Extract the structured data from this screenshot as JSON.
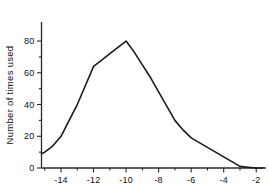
{
  "chart_data": {
    "type": "line",
    "title": "",
    "xlabel": "",
    "ylabel": "Number of times used",
    "xlim": [
      -15.2,
      -1.4
    ],
    "ylim": [
      0,
      92
    ],
    "grid": false,
    "legend": null,
    "axis_style": "left-and-bottom-spines-with-outward-ticks",
    "x_ticks_major": [
      -14,
      -12,
      -10,
      -8,
      -6,
      -4,
      -2
    ],
    "x_tick_labels": [
      "-14",
      "-12",
      "-10",
      "-8",
      "-6",
      "-4",
      "-2"
    ],
    "x_ticks_minor": [
      -15,
      -13,
      -11,
      -9,
      -7,
      -5,
      -3
    ],
    "y_ticks_major": [
      0,
      20,
      40,
      60,
      80
    ],
    "y_tick_labels": [
      "0",
      "20",
      "40",
      "60",
      "80"
    ],
    "y_ticks_minor": [
      10,
      30,
      50,
      70
    ],
    "x": [
      -15.2,
      -15,
      -14.5,
      -14,
      -13.5,
      -13,
      -12.5,
      -12,
      -11.5,
      -11,
      -10.5,
      -10,
      -9.5,
      -9,
      -8.5,
      -8,
      -7.5,
      -7,
      -6.5,
      -6,
      -5.5,
      -5,
      -4.5,
      -4,
      -3.5,
      -3,
      -2.5,
      -2,
      -1.6
    ],
    "values": [
      9,
      10,
      14,
      20,
      30,
      40,
      52,
      64,
      68,
      72,
      76,
      80,
      73,
      65,
      57,
      48,
      39,
      30,
      24,
      19,
      16,
      13,
      10,
      7,
      4,
      1,
      0.5,
      0,
      0
    ],
    "series": [
      {
        "name": "Number of times used",
        "color": "#1a1a1a",
        "line_width": 1.6,
        "marker": "none",
        "values": [
          9,
          10,
          14,
          20,
          30,
          40,
          52,
          64,
          68,
          72,
          76,
          80,
          73,
          65,
          57,
          48,
          39,
          30,
          24,
          19,
          16,
          13,
          10,
          7,
          4,
          1,
          0.5,
          0,
          0
        ]
      }
    ],
    "annotations": [
      {
        "label": "peak",
        "x": -10,
        "y": 80
      },
      {
        "label": "shoulder",
        "x": -12,
        "y": 64
      },
      {
        "label": "knee",
        "x": -7,
        "y": 30
      },
      {
        "label": "tail-zero",
        "x": -3,
        "y": 1
      }
    ]
  },
  "figure": {
    "background_color": "#ffffff",
    "line_color": "#1a1a1a",
    "axis_color": "#2a2a2a"
  }
}
